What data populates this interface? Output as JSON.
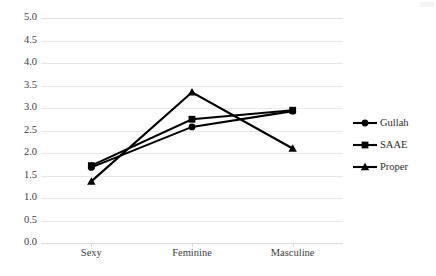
{
  "chart_data": {
    "type": "line",
    "title": "",
    "subtitle": "",
    "xlabel": "",
    "ylabel": "",
    "categories": [
      "Sexy",
      "Feminine",
      "Masculine"
    ],
    "series": [
      {
        "name": "Gullah",
        "marker": "circle",
        "color": "#000000",
        "values": [
          1.68,
          2.58,
          2.93
        ]
      },
      {
        "name": "SAAE",
        "marker": "square",
        "color": "#000000",
        "values": [
          1.72,
          2.75,
          2.95
        ]
      },
      {
        "name": "Proper",
        "marker": "triangle",
        "color": "#000000",
        "values": [
          1.37,
          3.35,
          2.1
        ]
      }
    ],
    "ylim": [
      0.0,
      5.0
    ],
    "ytick_step": 0.5,
    "yticks": [
      "5.0",
      "4.5",
      "4.0",
      "3.5",
      "3.0",
      "2.5",
      "2.0",
      "1.5",
      "1.0",
      "0.5",
      "0.0"
    ],
    "grid": true,
    "grid_color": "#e8e8e8",
    "legend_position": "right",
    "legend": [
      "Gullah",
      "SAAE",
      "Proper"
    ],
    "annotations": []
  }
}
